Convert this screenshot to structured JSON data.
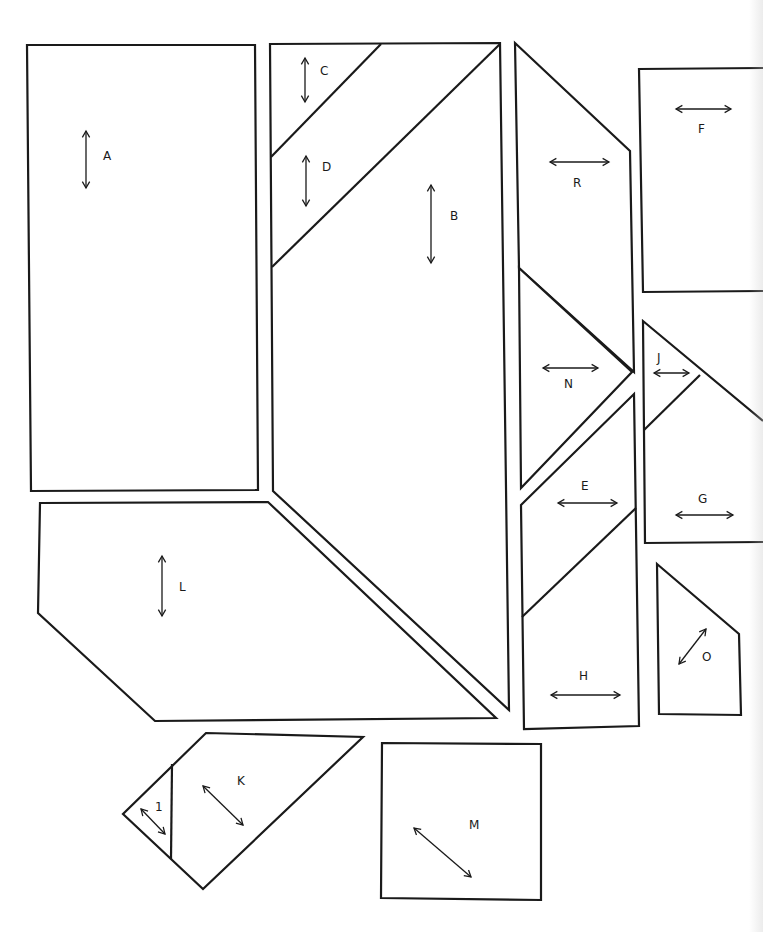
{
  "diagram": {
    "type": "pattern-pieces",
    "pieces": [
      {
        "id": "A",
        "label": "A",
        "grain": "vertical"
      },
      {
        "id": "B",
        "label": "B",
        "grain": "vertical"
      },
      {
        "id": "C",
        "label": "C",
        "grain": "vertical"
      },
      {
        "id": "D",
        "label": "D",
        "grain": "vertical"
      },
      {
        "id": "E",
        "label": "E",
        "grain": "horizontal"
      },
      {
        "id": "F",
        "label": "F",
        "grain": "horizontal"
      },
      {
        "id": "G",
        "label": "G",
        "grain": "horizontal"
      },
      {
        "id": "H",
        "label": "H",
        "grain": "horizontal"
      },
      {
        "id": "I",
        "label": "1",
        "grain": "diagonal"
      },
      {
        "id": "J",
        "label": "J",
        "grain": "horizontal"
      },
      {
        "id": "K",
        "label": "K",
        "grain": "diagonal"
      },
      {
        "id": "L",
        "label": "L",
        "grain": "vertical"
      },
      {
        "id": "M",
        "label": "M",
        "grain": "diagonal"
      },
      {
        "id": "N",
        "label": "N",
        "grain": "horizontal"
      },
      {
        "id": "O",
        "label": "O",
        "grain": "diagonal"
      },
      {
        "id": "R",
        "label": "R",
        "grain": "horizontal"
      }
    ],
    "colors": {
      "line": "#1a1a1a",
      "background": "#ffffff"
    }
  }
}
